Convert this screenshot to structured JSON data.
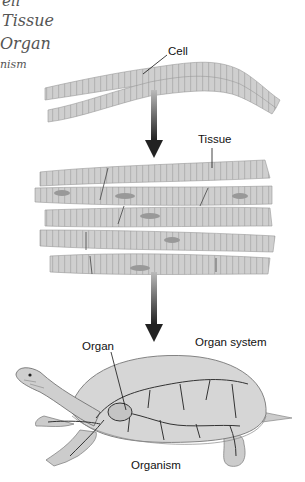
{
  "handwritten_notes": [
    "ell",
    "Tissue",
    "Organ",
    "nism"
  ],
  "diagram": {
    "labels": {
      "cell": "Cell",
      "tissue": "Tissue",
      "organ": "Organ",
      "organ_system": "Organ system",
      "organism": "Organism"
    },
    "colors": {
      "fiber": "#c9c9c9",
      "fiber_dark": "#9a9a9a",
      "arrow": "#333333",
      "ink": "#111111"
    }
  }
}
